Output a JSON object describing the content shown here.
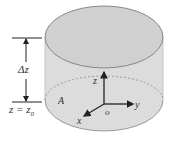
{
  "diagram": {
    "labels": {
      "delta_z": "Δz",
      "z_eq": "z = z",
      "z_sub": "0",
      "area": "A",
      "axis_x": "x",
      "axis_y": "y",
      "axis_z": "z",
      "origin": "o"
    },
    "colors": {
      "fill": "#d9d9d9",
      "top_fill": "#cfcfcf",
      "stroke": "#8a8a8a",
      "text": "#333333"
    }
  }
}
